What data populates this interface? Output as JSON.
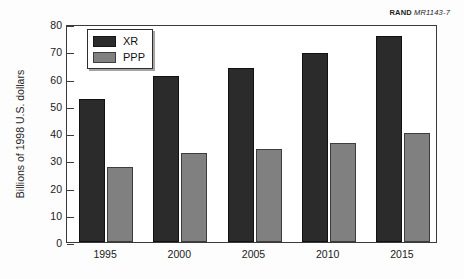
{
  "source_label": {
    "name": "RAND",
    "id": "MR1143-7"
  },
  "legend": {
    "items": [
      {
        "key": "XR",
        "label": "XR",
        "color": "#2b2b2b"
      },
      {
        "key": "PPP",
        "label": "PPP",
        "color": "#808080"
      }
    ]
  },
  "chart_data": {
    "type": "bar",
    "title": "",
    "subtitle": "",
    "xlabel": "",
    "ylabel": "Billions of 1998 U.S. dollars",
    "categories": [
      "1995",
      "2000",
      "2005",
      "2010",
      "2015"
    ],
    "series": [
      {
        "name": "XR",
        "color": "#2b2b2b",
        "values": [
          52.5,
          61,
          64,
          69.5,
          75.5
        ]
      },
      {
        "name": "PPP",
        "color": "#808080",
        "values": [
          27.5,
          32.5,
          34,
          36.5,
          40
        ]
      }
    ],
    "ylim": [
      0,
      80
    ],
    "yticks": [
      0,
      10,
      20,
      30,
      40,
      50,
      60,
      70,
      80
    ],
    "ytick_labels": [
      "0",
      "10",
      "20",
      "30",
      "40",
      "50",
      "60",
      "70",
      "80"
    ],
    "grid": false,
    "legend_position": "top-left",
    "annotations": [
      "RAND MR1143-7"
    ]
  }
}
